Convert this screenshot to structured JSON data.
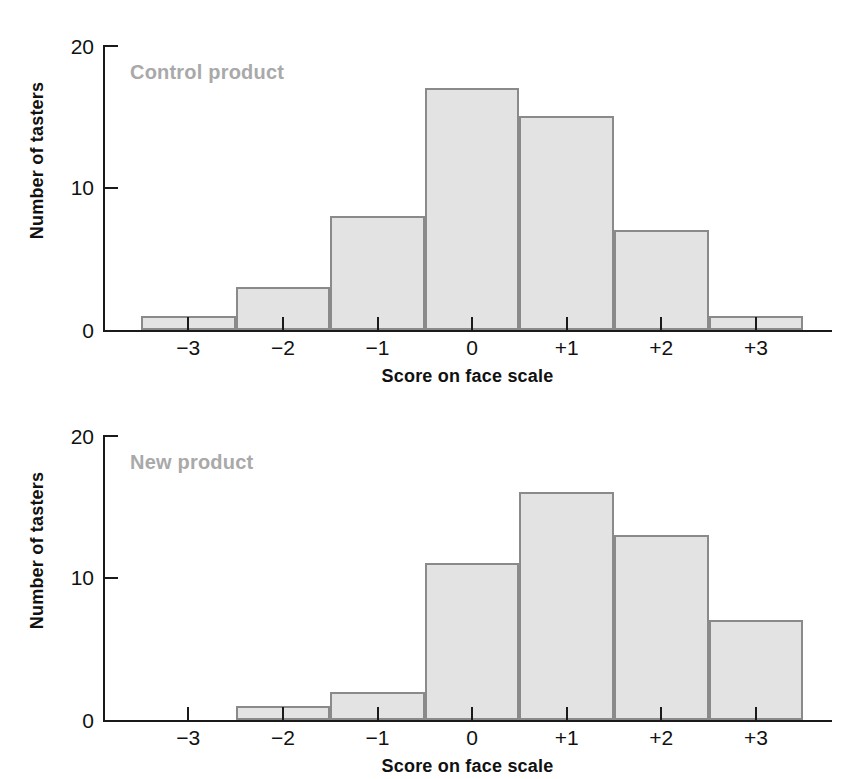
{
  "chart_data": [
    {
      "type": "bar",
      "title": "Control product",
      "xlabel": "Score on face scale",
      "ylabel": "Number of tasters",
      "categories": [
        "−3",
        "−2",
        "−1",
        "0",
        "+1",
        "+2",
        "+3"
      ],
      "values": [
        1,
        3,
        8,
        17,
        15,
        7,
        1
      ],
      "ylim": [
        0,
        20
      ],
      "yticks": [
        0,
        10,
        20
      ],
      "ytick_labels": [
        "0",
        "10",
        "20"
      ],
      "grid": false,
      "legend": "none",
      "bar_fill": "#e3e3e3",
      "bar_edge": "#8a8a8a",
      "label_color": "#a9a9a9"
    },
    {
      "type": "bar",
      "title": "New product",
      "xlabel": "Score on face scale",
      "ylabel": "Number of tasters",
      "categories": [
        "−3",
        "−2",
        "−1",
        "0",
        "+1",
        "+2",
        "+3"
      ],
      "values": [
        0,
        1,
        2,
        11,
        16,
        13,
        7
      ],
      "ylim": [
        0,
        20
      ],
      "yticks": [
        0,
        10,
        20
      ],
      "ytick_labels": [
        "0",
        "10",
        "20"
      ],
      "grid": false,
      "legend": "none",
      "bar_fill": "#e3e3e3",
      "bar_edge": "#8a8a8a",
      "label_color": "#a9a9a9"
    }
  ],
  "panels": [
    {
      "name": "control-product",
      "label": "Control product",
      "xaxis_title": "Score on face scale",
      "yaxis_title": "Number of tasters",
      "ytick_labels": [
        "20",
        "10",
        "0"
      ],
      "xtick_labels": [
        "−3",
        "−2",
        "−1",
        "0",
        "+1",
        "+2",
        "+3"
      ],
      "values": [
        1,
        3,
        8,
        17,
        15,
        7,
        1
      ]
    },
    {
      "name": "new-product",
      "label": "New product",
      "xaxis_title": "Score on face scale",
      "yaxis_title": "Number of tasters",
      "ytick_labels": [
        "20",
        "10",
        "0"
      ],
      "xtick_labels": [
        "−3",
        "−2",
        "−1",
        "0",
        "+1",
        "+2",
        "+3"
      ],
      "values": [
        0,
        1,
        2,
        11,
        16,
        13,
        7
      ]
    }
  ]
}
